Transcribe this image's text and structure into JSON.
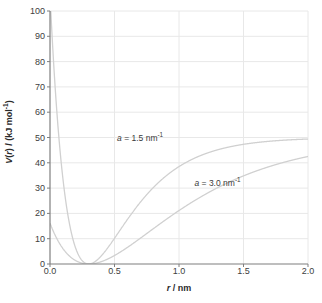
{
  "chart_data": {
    "type": "line",
    "title": "",
    "xlabel": "r / nm",
    "ylabel": "V(r) / (kJ mol⁻¹)",
    "xlim": [
      0.0,
      2.0
    ],
    "ylim": [
      0,
      100
    ],
    "xticks": [
      "0.0",
      "0.5",
      "1.0",
      "1.5",
      "2.0"
    ],
    "xtick_values": [
      0.0,
      0.5,
      1.0,
      1.5,
      2.0
    ],
    "yticks": [
      "0",
      "10",
      "20",
      "30",
      "40",
      "50",
      "60",
      "70",
      "80",
      "90",
      "100"
    ],
    "ytick_values": [
      0,
      10,
      20,
      30,
      40,
      50,
      60,
      70,
      80,
      90,
      100
    ],
    "grid": "both",
    "legend_position": "inline-annotations",
    "line_color": "#d0d0d0",
    "axis_color": "#7f7f7f",
    "grid_color": "#e8e8e8",
    "model": "Morse potential V(r) = D[1 - exp(-a(r - re))]^2",
    "parameters": {
      "D_kJ_per_mol": 50,
      "re_nm": 0.3
    },
    "annotations": [
      {
        "text": "a = 1.5 nm⁻¹",
        "x": 0.52,
        "y": 49.5
      },
      {
        "text": "a = 3.0 nm⁻¹",
        "x": 1.12,
        "y": 31.5
      }
    ],
    "series": [
      {
        "name": "a = 1.5 nm⁻¹",
        "a": 1.5,
        "x": [
          0.02,
          0.05,
          0.1,
          0.15,
          0.18,
          0.2,
          0.22,
          0.24,
          0.26,
          0.28,
          0.3,
          0.32,
          0.35,
          0.4,
          0.45,
          0.5,
          0.6,
          0.7,
          0.8,
          0.9,
          1.0,
          1.1,
          1.2,
          1.3,
          1.4,
          1.5,
          1.6,
          1.7,
          1.8,
          1.9,
          2.0
        ],
        "y": [
          222.6,
          156.5,
          84.3,
          38.3,
          21.2,
          13.6,
          7.9,
          4.0,
          1.7,
          0.4,
          0.0,
          0.3,
          1.8,
          5.9,
          11.1,
          16.5,
          25.7,
          32.7,
          37.8,
          41.4,
          44.0,
          45.8,
          47.1,
          48.0,
          48.6,
          49.0,
          49.3,
          49.5,
          49.7,
          49.8,
          49.8
        ]
      },
      {
        "name": "a = 3.0 nm⁻¹",
        "a": 3.0,
        "x": [
          0.02,
          0.04,
          0.06,
          0.08,
          0.1,
          0.12,
          0.14,
          0.16,
          0.18,
          0.2,
          0.22,
          0.24,
          0.26,
          0.28,
          0.3,
          0.32,
          0.35,
          0.4,
          0.45,
          0.5,
          0.55,
          0.6,
          0.65,
          0.7,
          0.75,
          0.8,
          0.9,
          1.0,
          1.1,
          1.2,
          1.3,
          1.4,
          1.5,
          1.6,
          1.8,
          2.0
        ],
        "y": [
          551.2,
          433.8,
          340.1,
          265.3,
          205.9,
          158.8,
          121.6,
          92.3,
          69.5,
          51.8,
          38.1,
          27.5,
          19.5,
          13.4,
          8.8,
          5.5,
          2.4,
          0.2,
          1.1,
          3.6,
          6.9,
          10.6,
          14.3,
          17.9,
          21.3,
          24.4,
          29.8,
          34.2,
          37.6,
          40.3,
          42.4,
          44.0,
          45.2,
          46.2,
          47.6,
          48.4
        ]
      }
    ]
  }
}
